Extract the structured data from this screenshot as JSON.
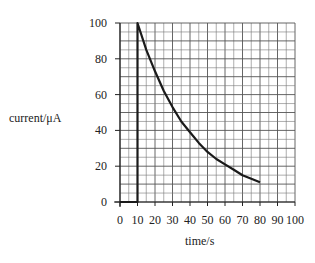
{
  "chart_data": {
    "type": "line",
    "title": "",
    "xlabel": "time/s",
    "ylabel": "current/μA",
    "xlim": [
      0,
      100
    ],
    "ylim": [
      0,
      100
    ],
    "x_ticks": [
      0,
      10,
      20,
      30,
      40,
      50,
      60,
      70,
      80,
      90,
      100
    ],
    "y_ticks": [
      0,
      20,
      40,
      60,
      80,
      100
    ],
    "grid": true,
    "grid_minor_x_step": 5,
    "grid_minor_y_step": 5,
    "legend": null,
    "series": [
      {
        "name": "current",
        "x": [
          0,
          10,
          10,
          15,
          20,
          25,
          30,
          35,
          40,
          45,
          50,
          55,
          60,
          65,
          70,
          75,
          80
        ],
        "y": [
          0,
          0,
          100,
          85,
          73,
          62,
          53,
          45,
          39,
          33,
          28,
          24,
          21,
          18,
          15,
          13,
          11
        ]
      }
    ]
  }
}
